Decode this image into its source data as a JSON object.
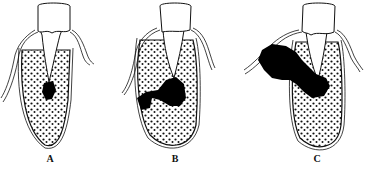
{
  "figure": {
    "panels": [
      {
        "id": "A",
        "label": "A",
        "description": "Periapical abscess localized at root apex within bone"
      },
      {
        "id": "B",
        "label": "B",
        "description": "Abscess spreading through cancellous bone toward cortical plate"
      },
      {
        "id": "C",
        "label": "C",
        "description": "Abscess perforated cortical plate forming subperiosteal/soft tissue swelling"
      }
    ],
    "colors": {
      "line": "#111111",
      "abscess": "#000000",
      "background": "#ffffff"
    }
  }
}
